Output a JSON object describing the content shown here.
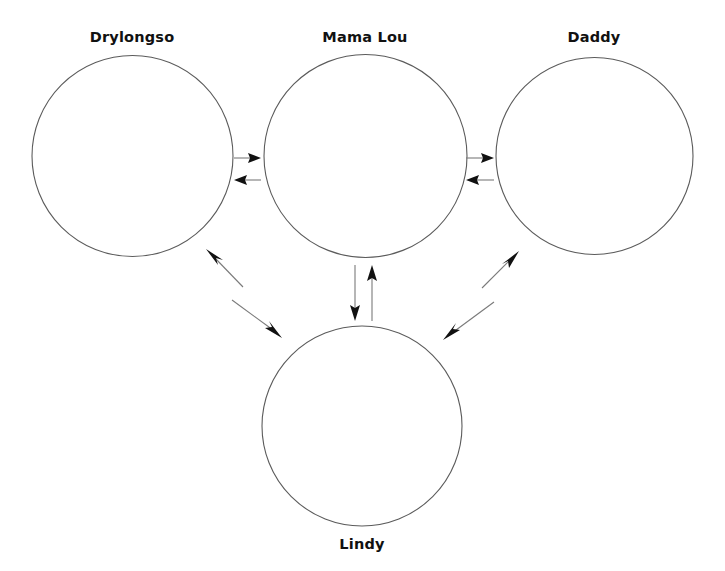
{
  "diagram": {
    "type": "relationship-network",
    "background_color": "#ffffff",
    "circle_stroke_color": "#5b5b5b",
    "arrow_color": "#111111",
    "line_color": "#7a7a7a",
    "label_color": "#111111",
    "nodes": [
      {
        "id": "drylongso",
        "label": "Drylongso",
        "cx": 132.5,
        "cy": 156,
        "r": 100.5,
        "label_x": 132,
        "label_y": 30
      },
      {
        "id": "mama-lou",
        "label": "Mama Lou",
        "cx": 365.5,
        "cy": 156,
        "r": 101.5,
        "label_x": 365,
        "label_y": 30
      },
      {
        "id": "daddy",
        "label": "Daddy",
        "cx": 594.5,
        "cy": 156,
        "r": 98.5,
        "label_x": 594,
        "label_y": 30
      },
      {
        "id": "lindy",
        "label": "Lindy",
        "cx": 362,
        "cy": 426,
        "r": 100,
        "label_x": 362,
        "label_y": 537
      }
    ],
    "edges": [
      {
        "id": "drylongso-to-mama-lou",
        "from": "drylongso",
        "to": "mama-lou",
        "direction": "right",
        "x1": 234,
        "y1": 158,
        "x2": 261,
        "y2": 158
      },
      {
        "id": "mama-lou-to-drylongso",
        "from": "mama-lou",
        "to": "drylongso",
        "direction": "left",
        "x1": 261,
        "y1": 180,
        "x2": 234,
        "y2": 180
      },
      {
        "id": "mama-lou-to-daddy",
        "from": "mama-lou",
        "to": "daddy",
        "direction": "right",
        "x1": 466,
        "y1": 158,
        "x2": 494,
        "y2": 158
      },
      {
        "id": "daddy-to-mama-lou",
        "from": "daddy",
        "to": "mama-lou",
        "direction": "left",
        "x1": 494,
        "y1": 180,
        "x2": 466,
        "y2": 180
      },
      {
        "id": "mama-lou-to-lindy",
        "from": "mama-lou",
        "to": "lindy",
        "direction": "down",
        "x1": 355,
        "y1": 265,
        "x2": 355,
        "y2": 321
      },
      {
        "id": "lindy-to-mama-lou",
        "from": "lindy",
        "to": "mama-lou",
        "direction": "up",
        "x1": 372,
        "y1": 321,
        "x2": 372,
        "y2": 265
      },
      {
        "id": "lindy-to-drylongso",
        "from": "lindy",
        "to": "drylongso",
        "direction": "up-left",
        "x1": 243,
        "y1": 287,
        "x2": 206,
        "y2": 249
      },
      {
        "id": "drylongso-to-lindy",
        "from": "drylongso",
        "to": "lindy",
        "direction": "down-right",
        "x1": 232,
        "y1": 300,
        "x2": 282,
        "y2": 338
      },
      {
        "id": "lindy-to-daddy",
        "from": "lindy",
        "to": "daddy",
        "direction": "up-right",
        "x1": 482,
        "y1": 288,
        "x2": 519,
        "y2": 251
      },
      {
        "id": "daddy-to-lindy",
        "from": "daddy",
        "to": "lindy",
        "direction": "down-left",
        "x1": 494,
        "y1": 302,
        "x2": 443,
        "y2": 340
      }
    ]
  }
}
